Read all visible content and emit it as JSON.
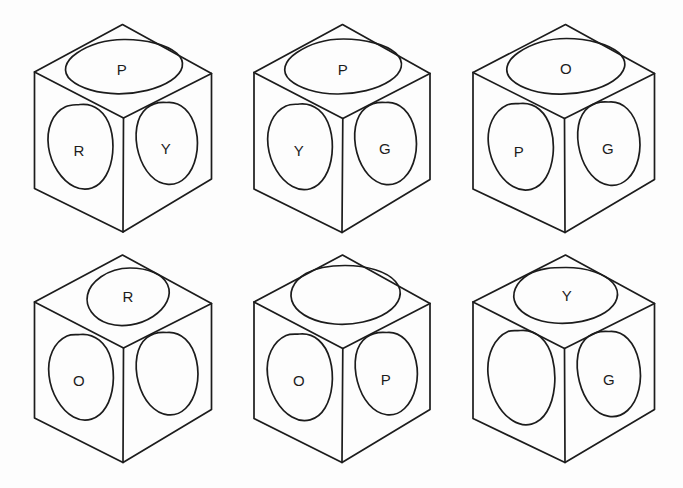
{
  "figure": {
    "kind": "line-drawing",
    "background_color": "#fdfdfd",
    "stroke_color": "#1c1c1c",
    "grid": {
      "rows": 2,
      "columns": 3
    },
    "legend_letters": [
      "P",
      "R",
      "Y",
      "G",
      "O"
    ]
  },
  "cubes": [
    {
      "id": "cube-1",
      "row": 1,
      "column": 1,
      "faces": {
        "top": "P",
        "left": "R",
        "right": "Y"
      }
    },
    {
      "id": "cube-2",
      "row": 1,
      "column": 2,
      "faces": {
        "top": "P",
        "left": "Y",
        "right": "G"
      }
    },
    {
      "id": "cube-3",
      "row": 1,
      "column": 3,
      "faces": {
        "top": "O",
        "left": "P",
        "right": "G"
      }
    },
    {
      "id": "cube-4",
      "row": 2,
      "column": 1,
      "faces": {
        "top": "R",
        "left": "O",
        "right": ""
      }
    },
    {
      "id": "cube-5",
      "row": 2,
      "column": 2,
      "faces": {
        "top": "",
        "left": "O",
        "right": "P"
      }
    },
    {
      "id": "cube-6",
      "row": 2,
      "column": 3,
      "faces": {
        "top": "Y",
        "left": "",
        "right": "G"
      }
    }
  ]
}
